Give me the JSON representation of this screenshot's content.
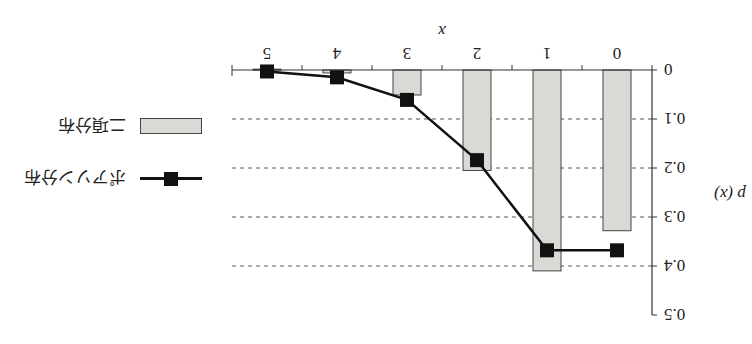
{
  "chart_data": {
    "type": "bar",
    "orientation_note": "figure is displayed rotated 180 degrees",
    "title": "",
    "xlabel": "x",
    "ylabel": "p (x)",
    "categories": [
      "0",
      "1",
      "2",
      "3",
      "4",
      "5"
    ],
    "ylim": [
      0,
      0.5
    ],
    "yticks": [
      "0",
      "0.1",
      "0.2",
      "0.3",
      "0.4",
      "0.5"
    ],
    "grid": "dashed horizontal at 0.1, 0.2, 0.3, 0.4",
    "legend_position": "right",
    "series": [
      {
        "name": "二項分布",
        "type": "bar",
        "color": "#d9d9d6",
        "values": [
          0.328,
          0.41,
          0.205,
          0.051,
          0.006,
          0.0003
        ]
      },
      {
        "name": "ポアソン分布",
        "type": "line",
        "marker": "square",
        "color": "#111111",
        "values": [
          0.368,
          0.368,
          0.184,
          0.061,
          0.015,
          0.003
        ]
      }
    ]
  },
  "legend": {
    "items": [
      {
        "label": "ポアソン分布",
        "kind": "line-marker"
      },
      {
        "label": "二項分布",
        "kind": "bar"
      }
    ]
  },
  "axes": {
    "x_title": "x",
    "y_title": "p (x)"
  }
}
